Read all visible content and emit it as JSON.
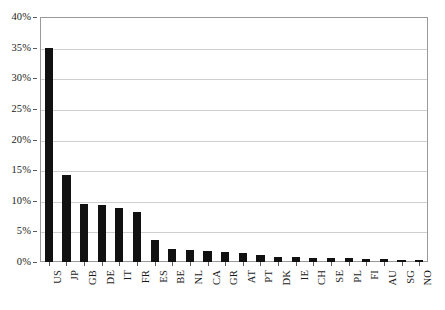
{
  "chart_data": {
    "type": "bar",
    "title": "",
    "subtitle": "",
    "xlabel": "",
    "ylabel": "",
    "categories": [
      "US",
      "JP",
      "GB",
      "DE",
      "IT",
      "FR",
      "ES",
      "BE",
      "NL",
      "CA",
      "GR",
      "AT",
      "PT",
      "DK",
      "IE",
      "CH",
      "SE",
      "PL",
      "FI",
      "AU",
      "SG",
      "NO"
    ],
    "values": [
      35.0,
      14.2,
      9.5,
      9.3,
      8.9,
      8.1,
      3.6,
      2.2,
      1.9,
      1.8,
      1.7,
      1.5,
      1.1,
      0.9,
      0.8,
      0.7,
      0.65,
      0.6,
      0.55,
      0.5,
      0.4,
      0.3
    ],
    "value_unit": "percent",
    "ylim": [
      0,
      40
    ],
    "ytick_values": [
      0,
      5,
      10,
      15,
      20,
      25,
      30,
      35,
      40
    ],
    "ytick_labels": [
      "0%",
      "5%",
      "10%",
      "15%",
      "20%",
      "25%",
      "30%",
      "35%",
      "40%"
    ],
    "grid": true,
    "grid_axis": "y",
    "legend": false,
    "legend_position": "none",
    "bar_color": "#111111",
    "grid_color": "#cfcfcf",
    "frame_color": "#9a9a9a",
    "xtick_label_rotation": 90,
    "series": [
      {
        "name": "share",
        "values": [
          35.0,
          14.2,
          9.5,
          9.3,
          8.9,
          8.1,
          3.6,
          2.2,
          1.9,
          1.8,
          1.7,
          1.5,
          1.1,
          0.9,
          0.8,
          0.7,
          0.65,
          0.6,
          0.55,
          0.5,
          0.4,
          0.3
        ]
      }
    ]
  }
}
